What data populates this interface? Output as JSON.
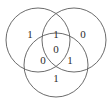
{
  "figure": {
    "type": "venn-diagram",
    "set_count": 3,
    "background_color": "#ffffff",
    "stroke_color": "#5a5a5a",
    "text_color": "#2b2b2b"
  },
  "circles": [
    {
      "id": "left",
      "name": "left-circle",
      "cx": 38,
      "cy": 40,
      "r": 32
    },
    {
      "id": "right",
      "name": "right-circle",
      "cx": 74,
      "cy": 40,
      "r": 32
    },
    {
      "id": "bottom",
      "name": "bottom-circle",
      "cx": 56,
      "cy": 65,
      "r": 32
    }
  ],
  "regions": [
    {
      "id": "left-only",
      "label": "1",
      "x": 30,
      "y": 35
    },
    {
      "id": "left-right",
      "label": "1",
      "x": 56,
      "y": 35
    },
    {
      "id": "right-only",
      "label": "0",
      "x": 83,
      "y": 35
    },
    {
      "id": "center-all",
      "label": "0",
      "x": 56,
      "y": 50
    },
    {
      "id": "left-bottom",
      "label": "0",
      "x": 43,
      "y": 61
    },
    {
      "id": "right-bottom",
      "label": "1",
      "x": 70,
      "y": 61
    },
    {
      "id": "bottom-only",
      "label": "1",
      "x": 56,
      "y": 79
    }
  ]
}
